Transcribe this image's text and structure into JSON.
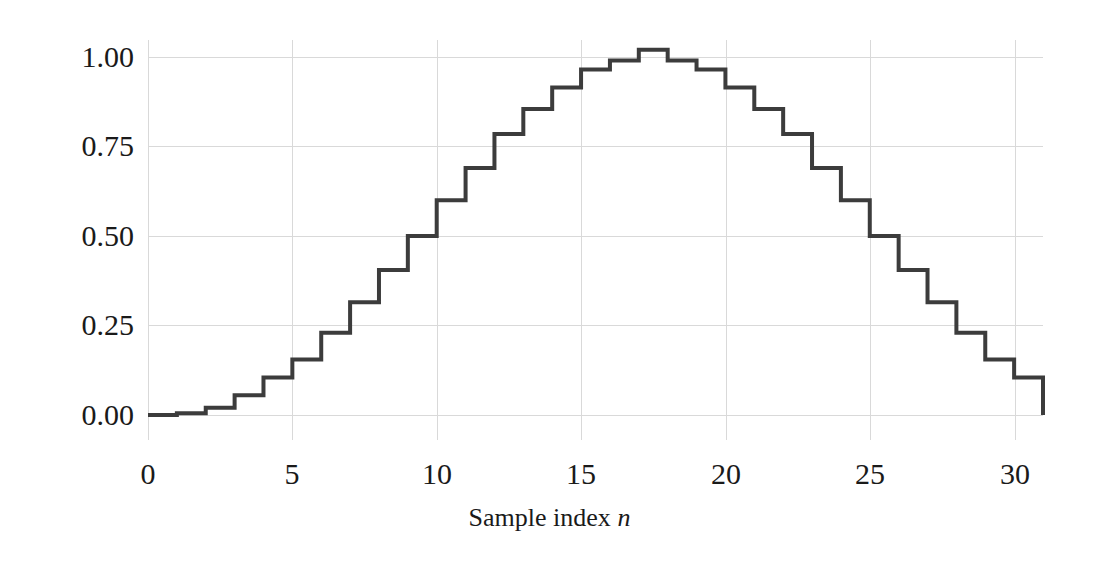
{
  "chart_data": {
    "type": "line",
    "subtype": "step-post",
    "title": "",
    "subtitle": "",
    "xlabel": "Sample index n",
    "xlabel_parts": {
      "text": "Sample index ",
      "italic_symbol": "n"
    },
    "ylabel": "",
    "x": [
      0,
      1,
      2,
      3,
      4,
      5,
      6,
      7,
      8,
      9,
      10,
      11,
      12,
      13,
      14,
      15,
      16,
      17,
      18,
      19,
      20,
      21,
      22,
      23,
      24,
      25,
      26,
      27,
      28,
      29,
      30,
      31
    ],
    "values": [
      0.0,
      0.005,
      0.02,
      0.055,
      0.105,
      0.155,
      0.23,
      0.315,
      0.405,
      0.5,
      0.6,
      0.69,
      0.785,
      0.855,
      0.915,
      0.965,
      0.99,
      1.02,
      0.99,
      0.965,
      0.915,
      0.855,
      0.785,
      0.69,
      0.6,
      0.5,
      0.405,
      0.315,
      0.23,
      0.155,
      0.105,
      0.045
    ],
    "series": [
      {
        "name": "window",
        "values": [
          0.0,
          0.005,
          0.02,
          0.055,
          0.105,
          0.155,
          0.23,
          0.315,
          0.405,
          0.5,
          0.6,
          0.69,
          0.785,
          0.855,
          0.915,
          0.965,
          0.99,
          1.02,
          0.99,
          0.965,
          0.915,
          0.855,
          0.785,
          0.69,
          0.6,
          0.5,
          0.405,
          0.315,
          0.23,
          0.155,
          0.105,
          0.045
        ],
        "color": "#3c3c3c",
        "line_width": 4
      }
    ],
    "xlim": [
      0,
      31
    ],
    "ylim": [
      -0.06,
      1.09
    ],
    "xticks": [
      0,
      5,
      10,
      15,
      20,
      25,
      30
    ],
    "xtick_labels": [
      "0",
      "5",
      "10",
      "15",
      "20",
      "25",
      "30"
    ],
    "yticks": [
      0.0,
      0.25,
      0.5,
      0.75,
      1.0
    ],
    "ytick_labels": [
      "0.00",
      "0.25",
      "0.50",
      "0.75",
      "1.00"
    ],
    "grid": true,
    "grid_color": "#d9d9d9",
    "legend": null,
    "legend_position": "none",
    "background_color": "#ffffff",
    "annotations": []
  },
  "figure": {
    "background_color": "#ffffff",
    "text_color": "#1a1a1a"
  }
}
